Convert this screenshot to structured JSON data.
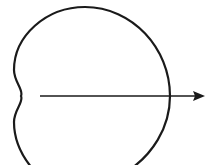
{
  "diagram": {
    "type": "limacon-with-arrow",
    "colors": {
      "background": "#ffffff",
      "stroke": "#1a1a1a"
    },
    "curve": {
      "stroke_width": 2.2
    },
    "arrow": {
      "direction": "right",
      "stroke_width": 1.6
    }
  }
}
